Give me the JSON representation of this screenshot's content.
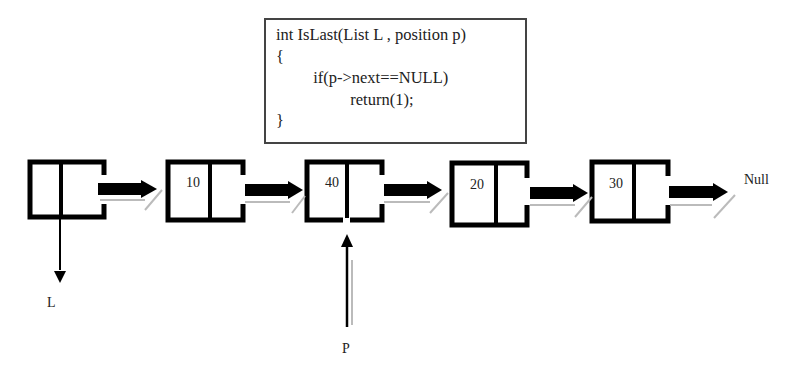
{
  "code": {
    "lines": [
      "int IsLast(List L , position p)",
      "{",
      "         if(p->next==NULL)",
      "                  return(1);",
      "}"
    ]
  },
  "nodes": [
    {
      "value": ""
    },
    {
      "value": "10"
    },
    {
      "value": "40"
    },
    {
      "value": "20"
    },
    {
      "value": "30"
    }
  ],
  "labels": {
    "null": "Null",
    "list_pointer": "L",
    "position_pointer": "P"
  }
}
